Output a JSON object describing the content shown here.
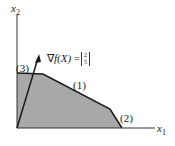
{
  "axes": {
    "x_label": "x",
    "x_sub": "1",
    "y_label": "x",
    "y_sub": "2"
  },
  "constraints": [
    {
      "label": "(1)"
    },
    {
      "label": "(2)"
    },
    {
      "label": "(3)"
    }
  ],
  "gradient": {
    "nabla": "∇",
    "func": "f",
    "arg": "(X)",
    "eq": "=",
    "vector": [
      "2",
      "5"
    ]
  },
  "colors": {
    "feasible_region": "#a8a8a8",
    "lines": "#1a1a1a"
  }
}
